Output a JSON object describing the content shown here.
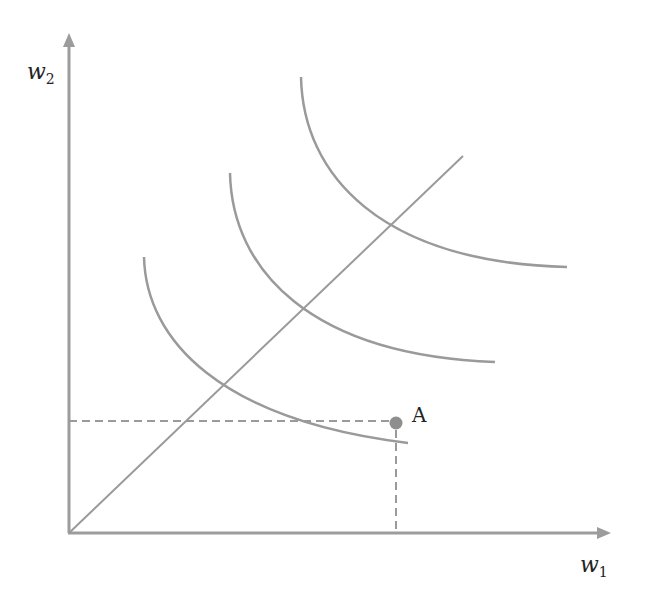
{
  "diagram": {
    "type": "isoquant-map",
    "axes": {
      "x_label": "w",
      "x_subscript": "1",
      "y_label": "w",
      "y_subscript": "2"
    },
    "point": {
      "label": "A"
    },
    "colors": {
      "line": "#9a9a9a",
      "axis": "#999999",
      "point": "#8e8e8e",
      "text": "#222222"
    },
    "curves": [
      {
        "name": "isoquant-1"
      },
      {
        "name": "isoquant-2"
      },
      {
        "name": "isoquant-3"
      }
    ]
  }
}
